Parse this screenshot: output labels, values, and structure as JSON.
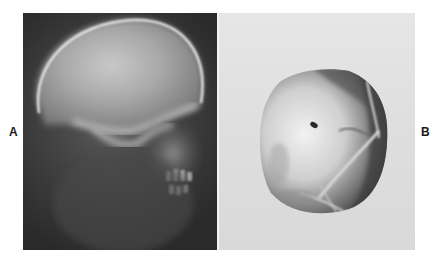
{
  "figure": {
    "panels": [
      {
        "label": "A",
        "description": "Lateral skull radiograph",
        "background_color": "#3a3a3a"
      },
      {
        "label": "B",
        "description": "Circular radiographic spot image on light background",
        "background_color": "#dedede"
      }
    ]
  }
}
